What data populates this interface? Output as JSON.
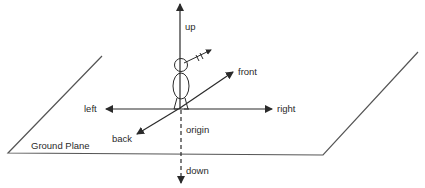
{
  "diagram": {
    "title": "",
    "labels": {
      "up": "up",
      "down": "down",
      "left": "left",
      "right": "right",
      "front": "front",
      "back": "back",
      "origin": "origin",
      "ground_plane": "Ground Plane"
    },
    "colors": {
      "ink": "#2a2a2a",
      "plane": "#555555",
      "background": "#ffffff"
    },
    "elements": [
      {
        "id": "up-axis",
        "type": "arrow",
        "style": "solid",
        "direction": "up"
      },
      {
        "id": "down-axis",
        "type": "arrow",
        "style": "dashed",
        "direction": "down"
      },
      {
        "id": "left-right-axis",
        "type": "double-arrow",
        "style": "solid"
      },
      {
        "id": "front-back-axis",
        "type": "double-arrow",
        "style": "solid"
      },
      {
        "id": "ground-plane",
        "type": "parallelogram"
      },
      {
        "id": "stick-figure",
        "type": "figure",
        "note": "person standing at origin with gaze arrow"
      }
    ]
  }
}
